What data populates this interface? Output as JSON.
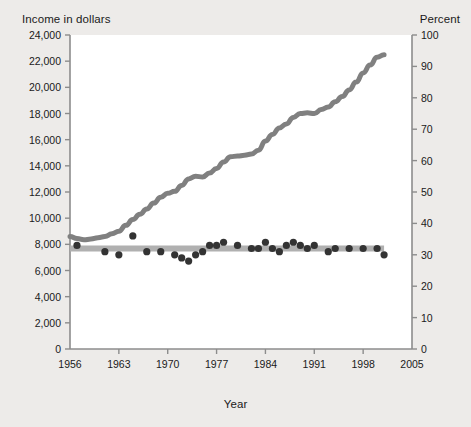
{
  "figure": {
    "background_color": "#edebe9",
    "plot_background_color": "#ffffff",
    "income_line_color": "#808080",
    "happy_line_color": "#b0b0b0",
    "happy_dot_color": "#333333",
    "axis_color": "#8c8c8c",
    "text_color": "#1a1a1a"
  },
  "labels": {
    "y_left_title": "Income in dollars",
    "y_right_title": "Percent",
    "x_title": "Year",
    "annotation_income_line1": "Personal income",
    "annotation_income_line2": "(in 1995 dollars)",
    "annotation_happy": "Percent very happy"
  },
  "chart_data": {
    "type": "line",
    "title": "",
    "xlabel": "Year",
    "ylabel": "Income in dollars",
    "y2label": "Percent",
    "xlim": [
      1956,
      2005
    ],
    "ylim": [
      0,
      24000
    ],
    "y2lim": [
      0,
      100
    ],
    "grid": false,
    "legend": "annotations",
    "x_ticks": [
      1956,
      1963,
      1970,
      1977,
      1984,
      1991,
      1998,
      2005
    ],
    "x_tick_labels": [
      "1956",
      "1963",
      "1970",
      "1977",
      "1984",
      "1991",
      "1998",
      "2005"
    ],
    "y_left_ticks": [
      0,
      2000,
      4000,
      6000,
      8000,
      10000,
      12000,
      14000,
      16000,
      18000,
      20000,
      22000,
      24000
    ],
    "y_left_tick_labels": [
      "0",
      "2,000",
      "4,000",
      "6,000",
      "8,000",
      "10,000",
      "12,000",
      "14,000",
      "16,000",
      "18,000",
      "20,000",
      "22,000",
      "24,000"
    ],
    "y_right_ticks": [
      0,
      10,
      20,
      30,
      40,
      50,
      60,
      70,
      80,
      90,
      100
    ],
    "y_right_tick_labels": [
      "0",
      "10",
      "20",
      "30",
      "40",
      "50",
      "60",
      "70",
      "80",
      "90",
      "100"
    ],
    "series": [
      {
        "name": "Personal income (in 1995 dollars)",
        "type": "line",
        "axis": "left",
        "color": "#808080",
        "x": [
          1956,
          1957,
          1958,
          1959,
          1960,
          1961,
          1962,
          1963,
          1964,
          1965,
          1966,
          1967,
          1968,
          1969,
          1970,
          1971,
          1972,
          1973,
          1974,
          1975,
          1976,
          1977,
          1978,
          1979,
          1980,
          1981,
          1982,
          1983,
          1984,
          1985,
          1986,
          1987,
          1988,
          1989,
          1990,
          1991,
          1992,
          1993,
          1994,
          1995,
          1996,
          1997,
          1998,
          1999,
          2000,
          2001
        ],
        "values": [
          8600,
          8450,
          8350,
          8400,
          8500,
          8600,
          8800,
          9000,
          9450,
          9900,
          10300,
          10700,
          11150,
          11600,
          11900,
          12050,
          12500,
          13000,
          13200,
          13150,
          13450,
          13800,
          14300,
          14700,
          14750,
          14800,
          14900,
          15200,
          15900,
          16400,
          16900,
          17200,
          17700,
          18000,
          18050,
          18000,
          18300,
          18500,
          18900,
          19300,
          19800,
          20400,
          21100,
          21700,
          22300,
          22500
        ]
      },
      {
        "name": "Percent very happy (trend)",
        "type": "line",
        "axis": "right",
        "color": "#b0b0b0",
        "x": [
          1956,
          2001
        ],
        "values": [
          32,
          32
        ]
      },
      {
        "name": "Percent very happy",
        "type": "scatter",
        "axis": "right",
        "color": "#333333",
        "x": [
          1957,
          1963,
          1965,
          1966,
          1970,
          1971,
          1972,
          1973,
          1974,
          1975,
          1976,
          1977,
          1978,
          1980,
          1982,
          1983,
          1984,
          1985,
          1986,
          1987,
          1988,
          1989,
          1990,
          1991,
          1993,
          1994,
          1996,
          1998,
          2000
        ],
        "values": [
          32,
          30,
          35,
          31,
          30,
          29,
          30,
          36,
          38,
          33,
          34,
          35,
          34,
          33,
          31,
          31,
          34,
          30,
          33,
          29,
          34,
          33,
          33,
          31,
          32,
          30,
          31,
          32,
          30
        ]
      }
    ],
    "happy_points_detailed": {
      "x": [
        1957,
        1961,
        1963,
        1965,
        1967,
        1969,
        1971,
        1972,
        1973,
        1974,
        1975,
        1976,
        1977,
        1978,
        1980,
        1982,
        1983,
        1984,
        1985,
        1986,
        1987,
        1988,
        1989,
        1990,
        1991,
        1993,
        1994,
        1996,
        1998,
        2000,
        2001
      ],
      "values": [
        33,
        31,
        30,
        36,
        31,
        31,
        30,
        29,
        28,
        30,
        31,
        33,
        33,
        34,
        33,
        32,
        32,
        34,
        32,
        31,
        33,
        34,
        33,
        32,
        33,
        31,
        32,
        32,
        32,
        32,
        30
      ]
    }
  }
}
